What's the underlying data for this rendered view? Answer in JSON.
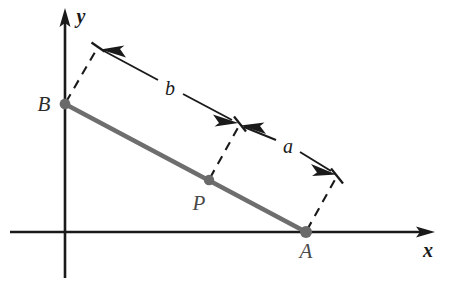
{
  "figure": {
    "background_color": "#ffffff"
  },
  "axes": {
    "x_label": "x",
    "y_label": "y",
    "origin": {
      "x": 65,
      "y": 232
    },
    "x_axis": {
      "x_start": 10,
      "x_end": 433,
      "y": 232
    },
    "y_axis": {
      "x": 65,
      "y_start": 278,
      "y_end": 10
    },
    "color": "#1a1a1a"
  },
  "points": [
    {
      "name": "B",
      "label": "B",
      "x": 65,
      "y": 104,
      "label_x": 44,
      "label_y": 104
    },
    {
      "name": "P",
      "label": "P",
      "x": 209,
      "y": 180,
      "label_x": 199,
      "label_y": 203
    },
    {
      "name": "A",
      "label": "A",
      "x": 306,
      "y": 232,
      "label_x": 306,
      "label_y": 251
    }
  ],
  "segment": {
    "from": "B",
    "to": "A",
    "color": "#6e6e6e",
    "width": 4.6
  },
  "dimensions": [
    {
      "name": "b",
      "label": "b",
      "label_x": 170,
      "label_y": 88,
      "from_tick": {
        "x": 240,
        "y": 124
      },
      "to_tick": {
        "x": 98,
        "y": 47
      },
      "describes": "distance from P to B"
    },
    {
      "name": "a",
      "label": "a",
      "label_x": 288,
      "label_y": 146,
      "from_tick": {
        "x": 240,
        "y": 124
      },
      "to_tick": {
        "x": 337,
        "y": 176
      },
      "describes": "distance from P to A"
    }
  ],
  "extension_lines": [
    {
      "name": "from-B",
      "x1": 65,
      "y1": 104,
      "x2": 98,
      "y2": 47
    },
    {
      "name": "from-P",
      "x1": 209,
      "y1": 180,
      "x2": 240,
      "y2": 124
    },
    {
      "name": "from-A",
      "x1": 306,
      "y1": 232,
      "x2": 337,
      "y2": 176
    }
  ],
  "style": {
    "dash_color": "#1a1a1a",
    "point_color": "#6a6a6a",
    "label_color": "#2b2b2b"
  }
}
